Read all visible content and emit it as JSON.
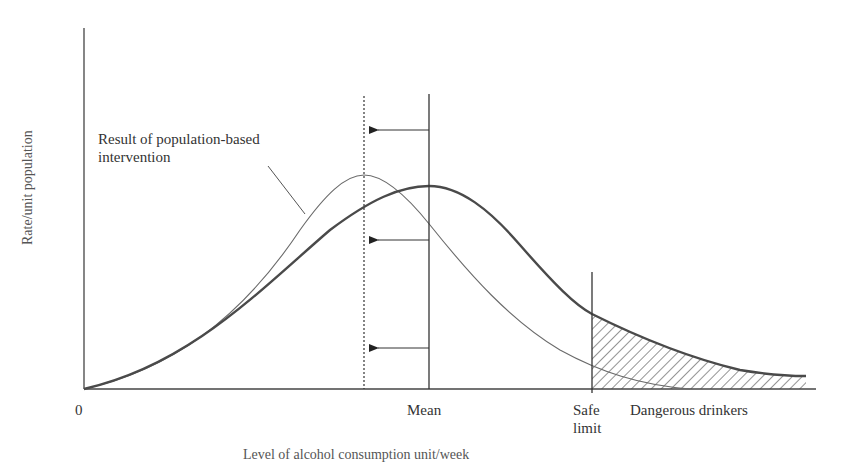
{
  "diagram": {
    "y_axis_label": "Rate/unit population",
    "x_axis_label": "Level of alcohol consumption unit/week",
    "origin_label": "0",
    "mean_label": "Mean",
    "safe_limit_label_line1": "Safe",
    "safe_limit_label_line2": "limit",
    "dangerous_label": "Dangerous drinkers",
    "annotation_line1": "Result of population-based",
    "annotation_line2": "intervention",
    "colors": {
      "axis": "#444444",
      "thick_curve": "#4a4a4a",
      "thin_curve": "#6a6a6a",
      "hatch": "#3a3a3a",
      "text": "#333333"
    },
    "elements": [
      {
        "name": "original-distribution",
        "style": "thick solid curve",
        "peak_at": "Mean"
      },
      {
        "name": "shifted-distribution",
        "style": "thin solid curve",
        "peak_at": "dotted line (new mean)"
      },
      {
        "name": "mean-line",
        "style": "solid vertical"
      },
      {
        "name": "new-mean-line",
        "style": "dotted vertical"
      },
      {
        "name": "shift-arrows",
        "count": 3,
        "direction": "left"
      },
      {
        "name": "safe-limit-line",
        "style": "solid vertical"
      },
      {
        "name": "dangerous-drinkers-area",
        "style": "hatched region right of safe limit"
      }
    ]
  }
}
